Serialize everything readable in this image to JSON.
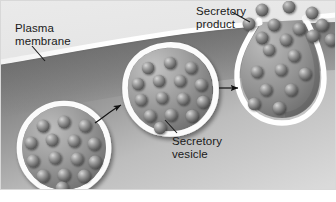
{
  "figure": {
    "frame": {
      "outer_background": "#ffffff",
      "panel_border": "#d8d8d8"
    },
    "labels": {
      "plasma_membrane": "Plasma\nmembrane",
      "secretory_product": "Secretory\nproduct",
      "secretory_vesicle": "Secretory\nvesicle"
    },
    "colors": {
      "extracellular": "#e3e3e3",
      "cytoplasm_dark": "#7d7d7d",
      "cytoplasm_light": "#d2d2d2",
      "membrane": "#ffffff",
      "vesicle_ring": "#fbfbfb",
      "vesicle_lumen_dark": "#6f6f6f",
      "vesicle_lumen_light": "#b4b4b4",
      "granule_light": "#c9c9c9",
      "granule_mid": "#8a8a8a",
      "granule_dark": "#5a5a5a",
      "text": "#1a1a1a",
      "leader_line": "#1a1a1a",
      "arrow": "#141414"
    },
    "structures": {
      "vesicle_left": {
        "name": "secretory vesicle (free in cytoplasm)",
        "granule_count": 15
      },
      "vesicle_middle": {
        "name": "secretory vesicle (docking at membrane)",
        "granule_count": 15
      },
      "vesicle_right": {
        "name": "secretory vesicle (fused, releasing contents)",
        "granule_count": 9
      },
      "released_granules": {
        "name": "secretory product released outside cell",
        "count": 11
      }
    },
    "arrows": [
      {
        "name": "arrow-left-to-middle",
        "from": "vesicle_left",
        "to": "vesicle_middle"
      },
      {
        "name": "arrow-middle-to-right",
        "from": "vesicle_middle",
        "to": "vesicle_right"
      }
    ]
  }
}
